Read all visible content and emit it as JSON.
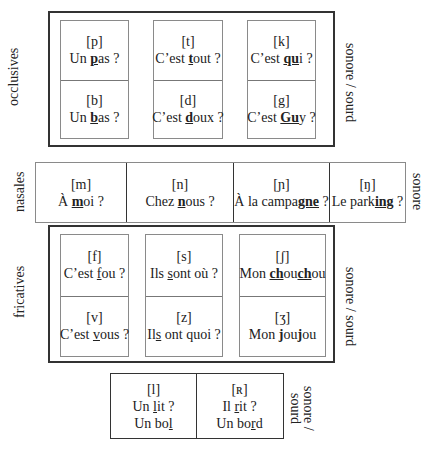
{
  "occlusives": {
    "label": "occlusives",
    "side_label": "sonore / sourd",
    "pairs": [
      {
        "top": {
          "ipa": "[p]",
          "pre": "Un ",
          "mark": "p",
          "post": "as ?"
        },
        "bottom": {
          "ipa": "[b]",
          "pre": "Un ",
          "mark": "b",
          "post": "as ?"
        }
      },
      {
        "top": {
          "ipa": "[t]",
          "pre": "C’est ",
          "mark": "t",
          "post": "out ?"
        },
        "bottom": {
          "ipa": "[d]",
          "pre": "C’est ",
          "mark": "d",
          "post": "oux ?"
        }
      },
      {
        "top": {
          "ipa": "[k]",
          "pre": "C’est ",
          "mark": "qu",
          "post": "i ?"
        },
        "bottom": {
          "ipa": "[g]",
          "pre": "C’est ",
          "mark": "Gu",
          "post": "y ?"
        }
      }
    ]
  },
  "nasales": {
    "label": "nasales",
    "side_label": "sonore",
    "cells": [
      {
        "ipa": "[m]",
        "pre": "À ",
        "mark": "m",
        "post": "oi ?"
      },
      {
        "ipa": "[n]",
        "pre": "Chez ",
        "mark": "n",
        "post": "ous ?"
      },
      {
        "ipa": "[ɲ]",
        "pre": "À la campa",
        "mark": "gne",
        "post": " ?"
      },
      {
        "ipa": "[ŋ]",
        "pre": "Le park",
        "mark": "ing",
        "post": " ?"
      }
    ]
  },
  "fricatives": {
    "label": "fricatives",
    "side_label": "sonore / sourd",
    "pairs": [
      {
        "top": {
          "ipa": "[f]",
          "pre": "C’est ",
          "mark": "f",
          "post": "ou ?"
        },
        "bottom": {
          "ipa": "[v]",
          "pre": "C’est ",
          "mark": "v",
          "post": "ous ?"
        }
      },
      {
        "top": {
          "ipa": "[s]",
          "pre": "Ils ",
          "mark": "s",
          "post": "ont où ?"
        },
        "bottom": {
          "ipa": "[z]",
          "pre": "Il",
          "mark": "s",
          "post": " ont quoi ?"
        }
      },
      {
        "top": {
          "ipa": "[ʃ]",
          "pre": "Mon ",
          "mark": "ch",
          "mid": "ou",
          "mark2": "ch",
          "post": "ou"
        },
        "bottom": {
          "ipa": "[ʒ]",
          "pre": "Mon ",
          "mark": "j",
          "mid": "ou",
          "mark2": "j",
          "post": "ou"
        }
      }
    ]
  },
  "liquides": {
    "side_label_1": "sonore /",
    "side_label_2": "sourd",
    "cells": [
      {
        "ipa": "[l]",
        "l1_pre": "Un ",
        "l1_mark": "l",
        "l1_post": "it ?",
        "l2_pre": "Un bo",
        "l2_mark": "l",
        "l2_post": ""
      },
      {
        "ipa": "[ʀ]",
        "l1_pre": "Il ",
        "l1_mark": "r",
        "l1_post": "it ?",
        "l2_pre": "Un bo",
        "l2_mark": "r",
        "l2_post": "d"
      }
    ]
  }
}
